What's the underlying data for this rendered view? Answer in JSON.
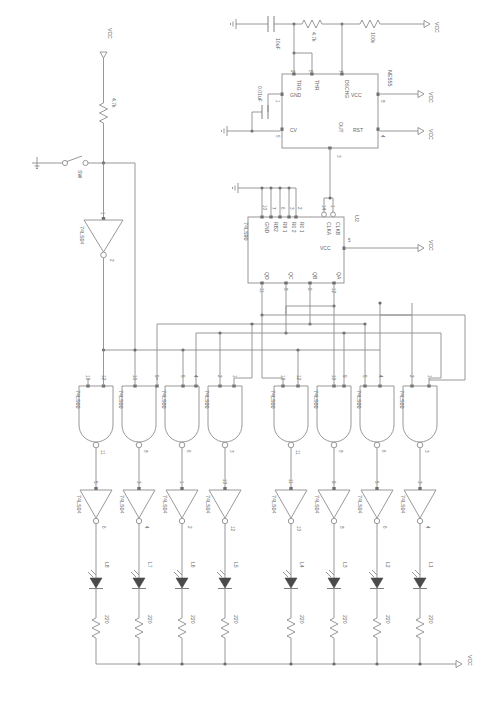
{
  "sheet": {
    "title": "",
    "background": "#ffffff",
    "wire_color": "#8c8c8c",
    "text_color": "#5f5f5f"
  },
  "nets": {
    "vcc_label": "VCC",
    "ground_label": ""
  },
  "timer": {
    "ref": "NE555",
    "pins": {
      "trg": "TRG",
      "thr": "THR",
      "gnd": "GND",
      "cv": "CV",
      "dschg": "DSCHG",
      "vcc": "VCC",
      "rst": "RST",
      "out": "OUT"
    },
    "pin_numbers": {
      "trg": "2",
      "thr": "6",
      "gnd": "1",
      "cv": "5",
      "dschg": "7",
      "vcc": "8",
      "rst": "4",
      "out": "3"
    }
  },
  "counter": {
    "ref": "74LS90",
    "designator": "U2",
    "pins": {
      "gnd": "GND",
      "rb2": "RB2",
      "r91": "R9 1",
      "r02": "R0 2",
      "r01": "R0 1",
      "clka": "CLKA",
      "clkb": "CLKB",
      "vcc": "VCC",
      "qd": "QD",
      "qc": "QC",
      "qb": "QB",
      "qa": "QA"
    },
    "pin_numbers": {
      "gnd": "10",
      "rb2": "7",
      "r91": "6",
      "r02": "3",
      "r01": "2",
      "clka": "14",
      "clkb": "1",
      "vcc": "5",
      "qd": "11",
      "qc": "8",
      "qb": "9",
      "qa": "12"
    }
  },
  "passives": [
    {
      "name": "C1",
      "value": "10uF",
      "type": "capacitor"
    },
    {
      "name": "C2",
      "value": "0.01uF",
      "type": "capacitor"
    },
    {
      "name": "R1",
      "value": "4.7k",
      "type": "resistor"
    },
    {
      "name": "R2",
      "value": "100k",
      "type": "resistor"
    },
    {
      "name": "R3",
      "value": "4.7k",
      "type": "resistor"
    }
  ],
  "switch": {
    "label": "SW"
  },
  "input_inverter": {
    "ref": "74LS04",
    "in_pin": "1",
    "out_pin": "2"
  },
  "nand_gates": [
    {
      "ref": "74LS00",
      "in_a": "13",
      "in_b": "12",
      "out": "11"
    },
    {
      "ref": "74LS00",
      "in_a": "10",
      "in_b": "9",
      "out": "8"
    },
    {
      "ref": "74LS00",
      "in_a": "5",
      "in_b": "4",
      "out": "6"
    },
    {
      "ref": "74LS00",
      "in_a": "2",
      "in_b": "1",
      "out": "3"
    },
    {
      "ref": "74LS00",
      "in_a": "13",
      "in_b": "12",
      "out": "11"
    },
    {
      "ref": "74LS00",
      "in_a": "10",
      "in_b": "9",
      "out": "8"
    },
    {
      "ref": "74LS00",
      "in_a": "5",
      "in_b": "4",
      "out": "6"
    },
    {
      "ref": "74LS00",
      "in_a": "2",
      "in_b": "1",
      "out": "3"
    }
  ],
  "inverters": [
    {
      "ref": "74LS04",
      "in_pin": "5",
      "out_pin": "6"
    },
    {
      "ref": "74LS04",
      "in_pin": "3",
      "out_pin": "4"
    },
    {
      "ref": "74LS04",
      "in_pin": "1",
      "out_pin": "2"
    },
    {
      "ref": "74LS04",
      "in_pin": "13",
      "out_pin": "12"
    },
    {
      "ref": "74LS04",
      "in_pin": "11",
      "out_pin": "10"
    },
    {
      "ref": "74LS04",
      "in_pin": "9",
      "out_pin": "8"
    },
    {
      "ref": "74LS04",
      "in_pin": "5",
      "out_pin": "6"
    },
    {
      "ref": "74LS04",
      "in_pin": "3",
      "out_pin": "4"
    }
  ],
  "leds": [
    {
      "name": "L8",
      "resistor": "220"
    },
    {
      "name": "L7",
      "resistor": "220"
    },
    {
      "name": "L6",
      "resistor": "220"
    },
    {
      "name": "L5",
      "resistor": "220"
    },
    {
      "name": "L4",
      "resistor": "220"
    },
    {
      "name": "L3",
      "resistor": "220"
    },
    {
      "name": "L2",
      "resistor": "220"
    },
    {
      "name": "L1",
      "resistor": "220"
    }
  ],
  "vcc_flags": [
    {
      "id": "vcc-top-left",
      "label": "VCC"
    },
    {
      "id": "vcc-top-right",
      "label": "VCC"
    },
    {
      "id": "vcc-555-vcc",
      "label": "VCC"
    },
    {
      "id": "vcc-555-rst",
      "label": "VCC"
    },
    {
      "id": "vcc-counter",
      "label": "VCC"
    },
    {
      "id": "vcc-bottom-rail",
      "label": "VCC"
    }
  ]
}
